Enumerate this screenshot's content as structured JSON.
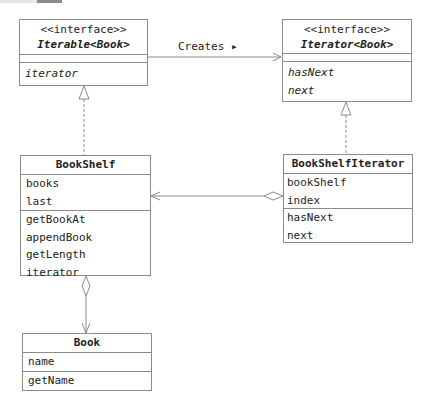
{
  "diagram": {
    "type": "UML class diagram",
    "classes": {
      "iterable": {
        "stereotype": "<<interface>>",
        "name": "Iterable<Book>",
        "attributes": [],
        "methods": [
          "iterator"
        ]
      },
      "iterator": {
        "stereotype": "<<interface>>",
        "name": "Iterator<Book>",
        "attributes": [],
        "methods": [
          "hasNext",
          "next"
        ]
      },
      "bookshelf": {
        "name": "BookShelf",
        "attributes": [
          "books",
          "last"
        ],
        "methods": [
          "getBookAt",
          "appendBook",
          "getLength",
          "iterator"
        ]
      },
      "bookshelf_iterator": {
        "name": "BookShelfIterator",
        "attributes": [
          "bookShelf",
          "index"
        ],
        "methods": [
          "hasNext",
          "next"
        ]
      },
      "book": {
        "name": "Book",
        "attributes": [
          "name"
        ],
        "methods": [
          "getName"
        ]
      }
    },
    "relations": [
      {
        "from": "Iterable<Book>",
        "to": "Iterator<Book>",
        "kind": "association",
        "label": "Creates ▸"
      },
      {
        "from": "BookShelf",
        "to": "Iterable<Book>",
        "kind": "realization"
      },
      {
        "from": "BookShelfIterator",
        "to": "Iterator<Book>",
        "kind": "realization"
      },
      {
        "from": "BookShelfIterator",
        "to": "BookShelf",
        "kind": "aggregation"
      },
      {
        "from": "BookShelf",
        "to": "Book",
        "kind": "aggregation"
      }
    ],
    "colors": {
      "line": "#8c8c8c",
      "text": "#222222",
      "background": "#ffffff"
    }
  }
}
